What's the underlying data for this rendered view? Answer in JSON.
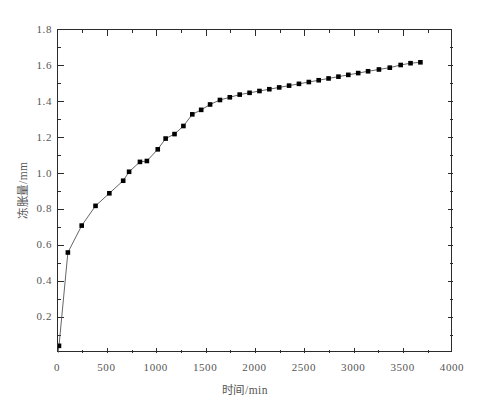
{
  "chart_data": {
    "type": "line",
    "title": "",
    "subtitle": "",
    "xlabel": "时间/min",
    "ylabel": "冻胀量/mm",
    "xlim": [
      0,
      4000
    ],
    "ylim": [
      0,
      1.8
    ],
    "xticks": [
      0,
      500,
      1000,
      1500,
      2000,
      2500,
      3000,
      3500,
      4000
    ],
    "xtick_labels": [
      "0",
      "500",
      "1000",
      "1500",
      "2000",
      "2500",
      "3000",
      "3500",
      "4000"
    ],
    "x_minor_step": 250,
    "yticks": [
      0.2,
      0.4,
      0.6,
      0.8,
      1.0,
      1.2,
      1.4,
      1.6,
      1.8
    ],
    "ytick_labels": [
      "0.2",
      "0.4",
      "0.6",
      "0.8",
      "1.0",
      "1.2",
      "1.4",
      "1.6",
      "1.8"
    ],
    "y_minor_step": 0.1,
    "grid": false,
    "legend": null,
    "legend_position": "none",
    "frame": "full-box",
    "tick_direction": "in",
    "line_color": "#555555",
    "marker_color": "#000000",
    "marker_style": "filled-square",
    "axis_color": "#2b2b2b",
    "series": [
      {
        "name": "冻胀量",
        "x": [
          10,
          100,
          240,
          380,
          520,
          660,
          720,
          830,
          900,
          1010,
          1090,
          1180,
          1270,
          1360,
          1450,
          1540,
          1640,
          1740,
          1840,
          1940,
          2040,
          2140,
          2240,
          2340,
          2440,
          2540,
          2640,
          2740,
          2840,
          2940,
          3040,
          3140,
          3250,
          3360,
          3470,
          3570,
          3670
        ],
        "y": [
          0.04,
          0.56,
          0.71,
          0.82,
          0.89,
          0.96,
          1.01,
          1.065,
          1.07,
          1.135,
          1.195,
          1.22,
          1.265,
          1.33,
          1.355,
          1.385,
          1.41,
          1.425,
          1.44,
          1.45,
          1.46,
          1.47,
          1.48,
          1.49,
          1.5,
          1.51,
          1.52,
          1.53,
          1.54,
          1.55,
          1.56,
          1.57,
          1.58,
          1.59,
          1.605,
          1.615,
          1.62
        ]
      }
    ]
  }
}
